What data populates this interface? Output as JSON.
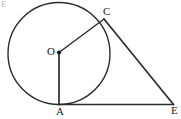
{
  "figure": {
    "kind": "geometry-diagram",
    "width": 181,
    "height": 119,
    "background_color": "#ffffff",
    "stroke_color": "#2b2b2b",
    "label_color": "#1a1a1a"
  },
  "corner_artifact": {
    "text": "E",
    "color": "#b9b9b9"
  },
  "labels": {
    "center": "O",
    "tangent_point_bottom": "A",
    "tangent_point_upper": "C",
    "external_point": "E"
  },
  "geometry": {
    "circle": {
      "name": "circle-O",
      "cx": 59,
      "cy": 53.5,
      "r": 51,
      "stroke_width": 1.4
    },
    "points": {
      "O": {
        "x": 59,
        "y": 52.5,
        "dot_radius": 2.1
      },
      "A": {
        "x": 59,
        "y": 104.5
      },
      "C": {
        "x": 104,
        "y": 19
      },
      "E": {
        "x": 173.5,
        "y": 104.5
      }
    },
    "segments": [
      {
        "name": "radius-OA",
        "from": "O",
        "to": "A",
        "stroke_width": 1.7
      },
      {
        "name": "radius-OC",
        "from": "O",
        "to": "C",
        "stroke_width": 1.4
      },
      {
        "name": "tangent-CE",
        "from": "C",
        "to": "E",
        "stroke_width": 1.7
      },
      {
        "name": "tangent-AE",
        "from": "A",
        "to": "E",
        "stroke_width": 1.5
      }
    ]
  }
}
